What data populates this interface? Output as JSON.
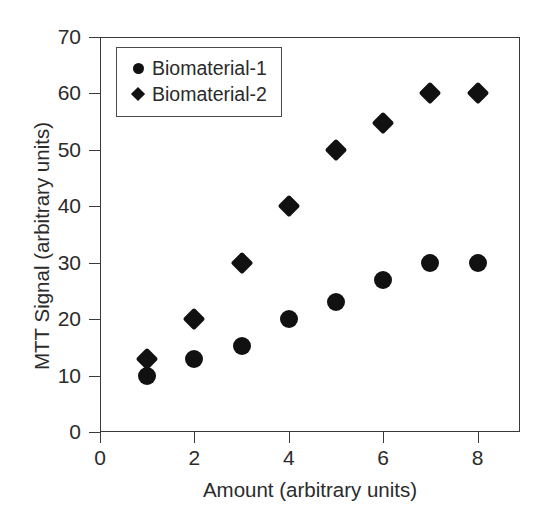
{
  "chart_data": {
    "type": "scatter",
    "title": "",
    "xlabel": "Amount (arbitrary units)",
    "ylabel": "MTT Signal (arbitrary units)",
    "xlim": [
      0,
      8.9
    ],
    "ylim": [
      0,
      70
    ],
    "xticks": [
      0,
      2,
      4,
      6,
      8
    ],
    "xtick_labels": [
      "0",
      "2",
      "4",
      "6",
      "8"
    ],
    "yticks": [
      0,
      10,
      20,
      30,
      40,
      50,
      60,
      70
    ],
    "ytick_labels": [
      "0",
      "10",
      "20",
      "30",
      "40",
      "50",
      "60",
      "70"
    ],
    "grid": false,
    "legend_position": "upper left",
    "marker_color": "#111111",
    "axis_color": "#3a3a3a",
    "series": [
      {
        "name": "Biomaterial-1",
        "marker": "circle",
        "x": [
          1,
          2,
          3,
          4,
          5,
          6,
          7,
          8
        ],
        "values": [
          10,
          13,
          15.2,
          20,
          23,
          27,
          30,
          30
        ]
      },
      {
        "name": "Biomaterial-2",
        "marker": "diamond",
        "x": [
          1,
          2,
          3,
          4,
          5,
          6,
          7,
          8
        ],
        "values": [
          13,
          20,
          30,
          40,
          50,
          54.7,
          60,
          60
        ]
      }
    ]
  },
  "legend": {
    "items": [
      {
        "label": "Biomaterial-1",
        "marker": "circle-marker-icon"
      },
      {
        "label": "Biomaterial-2",
        "marker": "diamond-marker-icon"
      }
    ]
  }
}
